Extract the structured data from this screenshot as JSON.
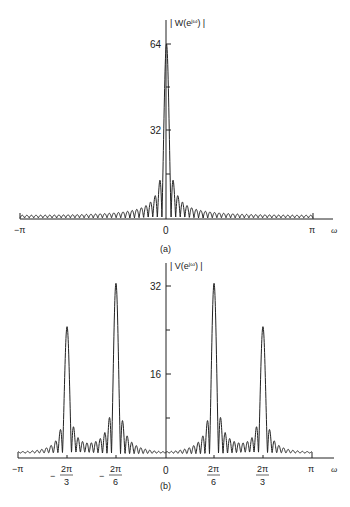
{
  "chart_data": [
    {
      "panel": "(a)",
      "type": "line",
      "title": "",
      "ylabel": "| W(e^{jω}) |",
      "xlabel": "ω",
      "x_ticks": [
        "−π",
        "0",
        "π"
      ],
      "y_ticks": [
        32,
        64
      ],
      "ylim": [
        0,
        70
      ],
      "xlim": [
        "−π",
        "π"
      ],
      "description": "Magnitude of DTFT of a length-64 rectangular window: main lobe peak 64 at ω=0 with decaying sidelobes",
      "peaks": [
        {
          "x": "0",
          "y": 64
        }
      ],
      "first_sidelobe_approx": 14,
      "grid": false
    },
    {
      "panel": "(b)",
      "type": "line",
      "title": "",
      "ylabel": "| V(e^{jω}) |",
      "xlabel": "ω",
      "x_ticks": [
        "−π",
        "−2π/3",
        "−2π/6",
        "0",
        "2π/6",
        "2π/3",
        "π"
      ],
      "y_ticks": [
        16,
        32
      ],
      "ylim": [
        0,
        35
      ],
      "xlim": [
        "−π",
        "π"
      ],
      "description": "Windowed spectrum of two sinusoids: peaks at ±2π/6 (≈32) and ±2π/3 (≈24)",
      "peaks": [
        {
          "x": "−2π/3",
          "y": 24
        },
        {
          "x": "−2π/6",
          "y": 31.5
        },
        {
          "x": "2π/6",
          "y": 31.5
        },
        {
          "x": "2π/3",
          "y": 24
        }
      ],
      "grid": false
    }
  ],
  "panel_a": {
    "ylabel": "| W(e",
    "ylabel_sup": "jω",
    "ylabel_end": ") |",
    "tick_64": "64",
    "tick_32": "32",
    "x_neg_pi": "−π",
    "x_zero": "0",
    "x_pi": "π",
    "x_axis_label": "ω",
    "caption": "(a)"
  },
  "panel_b": {
    "ylabel": "| V(e",
    "ylabel_sup": "jω",
    "ylabel_end": ") |",
    "tick_32": "32",
    "tick_16": "16",
    "x_neg_pi": "−π",
    "x_zero": "0",
    "x_pi": "π",
    "x_axis_label": "ω",
    "num": "2π",
    "den3": "3",
    "den6": "6",
    "minus": "−",
    "caption": "(b)"
  }
}
